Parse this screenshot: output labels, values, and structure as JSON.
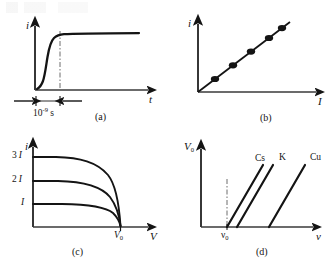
{
  "figure": {
    "background_color": "#ffffff",
    "ink_color": "#141414",
    "width": 336,
    "height": 266
  },
  "panels": [
    {
      "id": "a",
      "caption": "(a)",
      "y_axis_label": "i",
      "x_axis_label": "t",
      "annotation": "10",
      "annotation_exponent": "-9",
      "annotation_unit": "s",
      "dashed_marker": true,
      "description": "Photocurrent i rises sharply then saturates versus time t"
    },
    {
      "id": "b",
      "caption": "(b)",
      "y_axis_label": "i",
      "x_axis_label": "I",
      "data_point_count": 5,
      "description": "Photocurrent i proportional to light intensity I, straight line through origin"
    },
    {
      "id": "c",
      "caption": "(c)",
      "y_axis_label": "i",
      "x_axis_label": "V",
      "y_ticks": [
        "3",
        "2",
        ""
      ],
      "y_tick_symbol": "I",
      "x_tick_label": "V",
      "x_tick_subscript": "0",
      "curve_count": 3,
      "description": "Three saturation current curves 3I, 2I, I all cutting off at stopping voltage V0"
    },
    {
      "id": "d",
      "caption": "(d)",
      "y_axis_label": "V",
      "y_axis_subscript": "0",
      "x_axis_label": "ν",
      "x_tick_label": "ν",
      "x_tick_subscript": "0",
      "dashed_marker": true,
      "series": [
        {
          "name": "Cs"
        },
        {
          "name": "K"
        },
        {
          "name": "Cu"
        }
      ],
      "description": "Stopping voltage V0 versus frequency nu for three metals, parallel lines"
    }
  ]
}
